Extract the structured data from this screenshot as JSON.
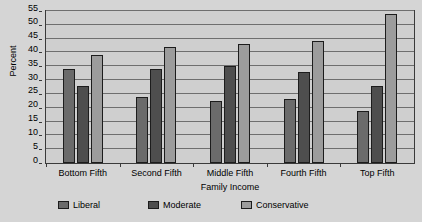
{
  "chart_data": {
    "type": "bar",
    "title": "",
    "xlabel": "Family Income",
    "ylabel": "Percent",
    "categories": [
      "Bottom Fifth",
      "Second Fifth",
      "Middle Fifth",
      "Fourth Fifth",
      "Top Fifth"
    ],
    "series": [
      {
        "name": "Liberal",
        "color": "#6b6b6b",
        "values": [
          34,
          24,
          22.5,
          23,
          19
        ]
      },
      {
        "name": "Moderate",
        "color": "#4e4e4e",
        "values": [
          28,
          34,
          35,
          33,
          28
        ]
      },
      {
        "name": "Conservative",
        "color": "#9c9c9c",
        "values": [
          39,
          42,
          43,
          44,
          54
        ]
      }
    ],
    "ylim": [
      0,
      55
    ],
    "yticks": [
      0,
      5,
      10,
      15,
      20,
      25,
      30,
      35,
      40,
      45,
      50,
      55
    ],
    "grid": true,
    "legend_position": "bottom"
  }
}
